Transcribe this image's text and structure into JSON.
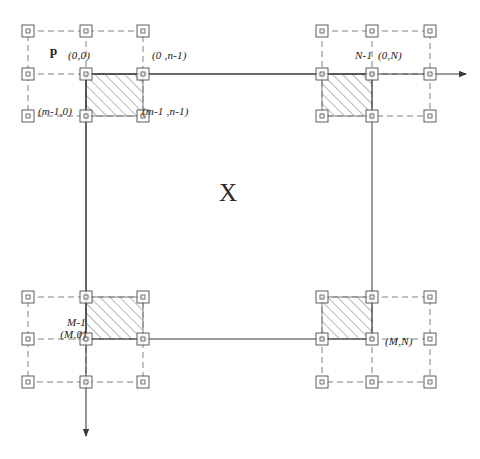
{
  "figure": {
    "center_label": "X",
    "plane_label": "p"
  },
  "colors": {
    "line": "#4d4d4d",
    "dash": "#808080",
    "hatch": "#707070",
    "text": "#1a1a1a",
    "background": "#ffffff"
  },
  "labels": [
    {
      "name": "plane-label-p",
      "text": "p",
      "x": 50,
      "y": 44,
      "style": "bold"
    },
    {
      "name": "label-0-0",
      "text": "(0,0)",
      "x": 68,
      "y": 50,
      "style": "italic"
    },
    {
      "name": "label-0-n-1",
      "text": "(0 ,n-1)",
      "x": 152,
      "y": 50,
      "style": "italic"
    },
    {
      "name": "label-n-1-0-n",
      "text": "N-1  (0,N)",
      "x": 355,
      "y": 50,
      "style": "italic"
    },
    {
      "name": "label-m-1-0",
      "text": "(m-1,0)",
      "x": 38,
      "y": 106,
      "style": "italic"
    },
    {
      "name": "label-m-1-n-1",
      "text": "(m-1 ,n-1)",
      "x": 142,
      "y": 106,
      "style": "italic"
    },
    {
      "name": "label-m-n",
      "text": "(M,N)",
      "x": 385,
      "y": 336,
      "style": "italic"
    }
  ],
  "label_m1_m0": {
    "name": "label-m-1-m-0",
    "line1": "M-1",
    "line2": "(M,0)",
    "x": 28,
    "y": 317
  },
  "axes": {
    "horizontal": {
      "name": "horizontal-axis-arrow",
      "x1": 86,
      "y1": 74,
      "x2": 466,
      "y2": 74,
      "direction": "right"
    },
    "vertical": {
      "name": "vertical-axis-arrow",
      "x1": 86,
      "y1": 74,
      "x2": 86,
      "y2": 436,
      "direction": "down"
    }
  },
  "corner_groups": [
    {
      "name": "corner-group-top-left",
      "cols": [
        28,
        86,
        143
      ],
      "rows": [
        31,
        74,
        116
      ],
      "hatch_block": {
        "col_start": 1,
        "col_end": 2,
        "row_start": 1,
        "row_end": 2
      }
    },
    {
      "name": "corner-group-top-right",
      "cols": [
        322,
        372,
        430
      ],
      "rows": [
        31,
        74,
        116
      ],
      "hatch_block": {
        "col_start": 0,
        "col_end": 1,
        "row_start": 1,
        "row_end": 2
      }
    },
    {
      "name": "corner-group-bottom-left",
      "cols": [
        28,
        86,
        143
      ],
      "rows": [
        297,
        339,
        382
      ],
      "hatch_block": {
        "col_start": 1,
        "col_end": 2,
        "row_start": 0,
        "row_end": 1
      }
    },
    {
      "name": "corner-group-bottom-right",
      "cols": [
        322,
        372,
        430
      ],
      "rows": [
        297,
        339,
        382
      ],
      "hatch_block": {
        "col_start": 0,
        "col_end": 1,
        "row_start": 0,
        "row_end": 1
      }
    }
  ],
  "solid_rectangle": {
    "name": "image-boundary-rectangle",
    "left": 86,
    "top": 74,
    "right": 372,
    "bottom": 339
  },
  "marker": {
    "name": "sample-point-marker",
    "outer_size": 12,
    "inner_size": 4
  },
  "center_label_pos": {
    "x": 228,
    "y": 196
  }
}
